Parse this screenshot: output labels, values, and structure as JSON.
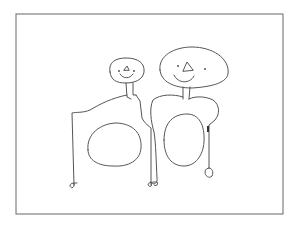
{
  "image": {
    "description": "Child-like pencil drawing of two figures inside a rectangular frame",
    "colors": {
      "background": "#ffffff",
      "line": "#555555",
      "frame": "#666666"
    },
    "figures": [
      {
        "name": "left-figure",
        "features": [
          "small round head",
          "dot eyes",
          "triangle nose",
          "smile",
          "neck",
          "arms",
          "oval belly",
          "legs with feet"
        ]
      },
      {
        "name": "right-figure",
        "features": [
          "large oval head",
          "dot eyes",
          "triangle nose",
          "smile",
          "neck",
          "rounded shoulders",
          "oval belly",
          "arm with hand"
        ]
      }
    ]
  }
}
